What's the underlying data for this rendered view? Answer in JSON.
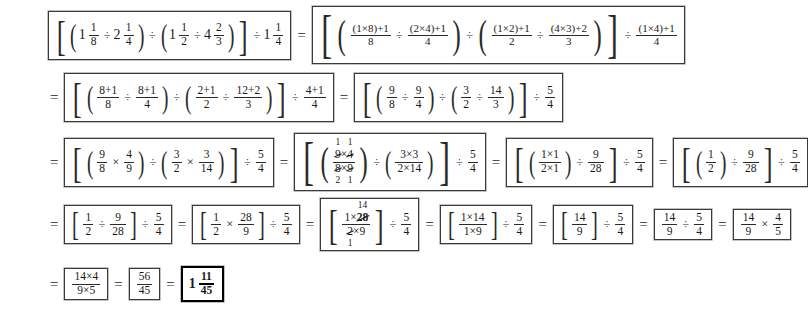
{
  "document": {
    "type": "worked-arithmetic-solution",
    "title": "Mixed number division worked solution",
    "equals_sign": "=",
    "operators": {
      "divide": "÷",
      "multiply": "×",
      "plus": "+"
    }
  },
  "steps": [
    {
      "id": "step-1",
      "line": 1,
      "expression_text": "[ (1 1/8 ÷ 2 1/4) ÷ (1 1/2 ÷ 4 2/3) ] ÷ 1 1/4",
      "values": {
        "a_whole": "1",
        "a_num": "1",
        "a_den": "8",
        "b_whole": "2",
        "b_num": "1",
        "b_den": "4",
        "c_whole": "1",
        "c_num": "1",
        "c_den": "2",
        "d_whole": "4",
        "d_num": "2",
        "d_den": "3",
        "e_whole": "1",
        "e_num": "1",
        "e_den": "4"
      }
    },
    {
      "id": "step-2",
      "line": 1,
      "expression_text": "[ ((1×8)+1)/8 ÷ ((2×4)+1)/4 ) ÷ ( ((1×2)+1)/2 ÷ ((4×3)+2)/3 ) ] ÷ ((1×4)+1)/4",
      "values": {
        "f1_num_a": "1",
        "f1_num_b": "8",
        "f1_num_c": "1",
        "f1_den": "8",
        "f2_num_a": "2",
        "f2_num_b": "4",
        "f2_num_c": "1",
        "f2_den": "4",
        "f3_num_a": "1",
        "f3_num_b": "2",
        "f3_num_c": "1",
        "f3_den": "2",
        "f4_num_a": "4",
        "f4_num_b": "3",
        "f4_num_c": "2",
        "f4_den": "3",
        "f5_num_a": "1",
        "f5_num_b": "4",
        "f5_num_c": "1",
        "f5_den": "4"
      }
    },
    {
      "id": "step-3",
      "line": 2,
      "expression_text": "[ (8+1)/8 ÷ (8+1)/4 ) ÷ ( (2+1)/2 ÷ (12+2)/3 ) ] ÷ (4+1)/4",
      "values": {
        "g1_n1": "8",
        "g1_n2": "1",
        "g1_d": "8",
        "g2_n1": "8",
        "g2_n2": "1",
        "g2_d": "4",
        "g3_n1": "2",
        "g3_n2": "1",
        "g3_d": "2",
        "g4_n1": "12",
        "g4_n2": "2",
        "g4_d": "3",
        "g5_n1": "4",
        "g5_n2": "1",
        "g5_d": "4"
      }
    },
    {
      "id": "step-4",
      "line": 2,
      "expression_text": "[ (9/8 ÷ 9/4) ÷ (3/2 ÷ 14/3) ] ÷ 5/4",
      "values": {
        "h1_n": "9",
        "h1_d": "8",
        "h2_n": "9",
        "h2_d": "4",
        "h3_n": "3",
        "h3_d": "2",
        "h4_n": "14",
        "h4_d": "3",
        "h5_n": "5",
        "h5_d": "4"
      }
    },
    {
      "id": "step-5",
      "line": 3,
      "expression_text": "[ (9/8 × 4/9) ÷ (3/2 × 3/14) ] ÷ 5/4",
      "values": {
        "i1_n": "9",
        "i1_d": "8",
        "i2_n": "4",
        "i2_d": "9",
        "i3_n": "3",
        "i3_d": "2",
        "i4_n": "3",
        "i4_d": "14",
        "i5_n": "5",
        "i5_d": "4"
      }
    },
    {
      "id": "step-6",
      "line": 3,
      "expression_text": "[ ( (9×4)/(8×9) with cancels 1,1 over 2,1 ) ÷ (3×3)/(2×14) ] ÷ 5/4",
      "values": {
        "c_top_a": "9",
        "c_top_b": "4",
        "c_bot_a": "8",
        "c_bot_b": "9",
        "c_above_a": "1",
        "c_above_b": "1",
        "c_below_a": "2",
        "c_below_b": "1",
        "j_num_a": "3",
        "j_num_b": "3",
        "j_den_a": "2",
        "j_den_b": "14",
        "j5_n": "5",
        "j5_d": "4"
      }
    },
    {
      "id": "step-7",
      "line": 3,
      "expression_text": "[ ((1×1)/(2×1)) ÷ 9/28 ] ÷ 5/4",
      "values": {
        "k_num_a": "1",
        "k_num_b": "1",
        "k_den_a": "2",
        "k_den_b": "1",
        "k2_n": "9",
        "k2_d": "28",
        "k5_n": "5",
        "k5_d": "4"
      }
    },
    {
      "id": "step-8",
      "line": 3,
      "expression_text": "[ (1/2) ÷ 9/28 ] ÷ 5/4",
      "values": {
        "l1_n": "1",
        "l1_d": "2",
        "l2_n": "9",
        "l2_d": "28",
        "l5_n": "5",
        "l5_d": "4"
      }
    },
    {
      "id": "step-9",
      "line": 4,
      "expression_text": "[ 1/2 ÷ 9/28 ] ÷ 5/4",
      "values": {
        "m1_n": "1",
        "m1_d": "2",
        "m2_n": "9",
        "m2_d": "28",
        "m5_n": "5",
        "m5_d": "4"
      }
    },
    {
      "id": "step-10",
      "line": 4,
      "expression_text": "[ 1/2 × 28/9 ] ÷ 5/4",
      "values": {
        "n1_n": "1",
        "n1_d": "2",
        "n2_n": "28",
        "n2_d": "9",
        "n5_n": "5",
        "n5_d": "4"
      }
    },
    {
      "id": "step-11",
      "line": 4,
      "expression_text": "[ (1×28)/(2×9) with 28 cancelled to 14 and 2 cancelled to 1 ] ÷ 5/4",
      "values": {
        "o_num_a": "1",
        "o_num_b": "28",
        "o_above": "14",
        "o_den_a": "2",
        "o_den_b": "9",
        "o_below": "1",
        "o5_n": "5",
        "o5_d": "4"
      }
    },
    {
      "id": "step-12",
      "line": 4,
      "expression_text": "[ (1×14)/(1×9) ] ÷ 5/4",
      "values": {
        "p_num_a": "1",
        "p_num_b": "14",
        "p_den_a": "1",
        "p_den_b": "9",
        "p5_n": "5",
        "p5_d": "4"
      }
    },
    {
      "id": "step-13",
      "line": 4,
      "expression_text": "[ 14/9 ] ÷ 5/4",
      "values": {
        "q1_n": "14",
        "q1_d": "9",
        "q5_n": "5",
        "q5_d": "4"
      }
    },
    {
      "id": "step-14",
      "line": 4,
      "expression_text": "14/9 ÷ 5/4",
      "values": {
        "r1_n": "14",
        "r1_d": "9",
        "r2_n": "5",
        "r2_d": "4"
      }
    },
    {
      "id": "step-15",
      "line": 4,
      "expression_text": "14/9 × 4/5",
      "values": {
        "s1_n": "14",
        "s1_d": "9",
        "s2_n": "4",
        "s2_d": "5"
      }
    },
    {
      "id": "step-16",
      "line": 5,
      "expression_text": "(14×4)/(9×5)",
      "values": {
        "t_num_a": "14",
        "t_num_b": "4",
        "t_den_a": "9",
        "t_den_b": "5"
      }
    },
    {
      "id": "step-17",
      "line": 5,
      "expression_text": "56/45",
      "values": {
        "u_n": "56",
        "u_d": "45"
      }
    },
    {
      "id": "step-18-answer",
      "line": 5,
      "expression_text": "1 11/45",
      "is_final_answer": true,
      "values": {
        "v_whole": "1",
        "v_n": "11",
        "v_d": "45"
      }
    }
  ],
  "delimiters": {
    "lparen": "(",
    "rparen": ")",
    "lbrack": "[",
    "rbrack": "]"
  }
}
